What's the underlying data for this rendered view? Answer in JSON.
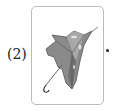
{
  "item": {
    "label": "(2)",
    "image": "umbrella-icon",
    "trailing": "."
  }
}
